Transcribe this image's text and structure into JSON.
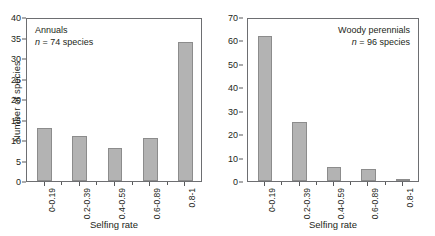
{
  "figure": {
    "background": "#ffffff",
    "bar_fill": "#b3b3b3",
    "bar_stroke": "#8c8c8c",
    "axis_color": "#6d6e71"
  },
  "chart_data": [
    {
      "type": "bar",
      "title": "Annuals",
      "subtitle": "n = 74 species",
      "subtitle_italic_prefix": "n",
      "subtitle_rest": " = 74 species",
      "categories": [
        "0-0.19",
        "0.2-0.39",
        "0.4-0.59",
        "0.6-0.89",
        "0.8-1"
      ],
      "values": [
        13,
        11,
        8,
        10.5,
        34
      ],
      "xlabel": "Selfing rate",
      "ylabel": "Number of species",
      "ylim": [
        0,
        40
      ],
      "yticks": [
        0,
        5,
        10,
        15,
        20,
        25,
        30,
        35,
        40
      ],
      "ytick_labels": [
        "0",
        "5",
        "10",
        "15",
        "20",
        "25",
        "30",
        "35",
        "40"
      ],
      "grid": false,
      "legend": "none",
      "caption_position": "top-left"
    },
    {
      "type": "bar",
      "title": "Woody perennials",
      "subtitle": "n = 96 species",
      "subtitle_italic_prefix": "n",
      "subtitle_rest": " = 96 species",
      "categories": [
        "0-0.19",
        "0.2-0.39",
        "0.4-0.59",
        "0.6-0.89",
        "0.8-1"
      ],
      "values": [
        62,
        25,
        6,
        5,
        1
      ],
      "xlabel": "Selfing rate",
      "ylabel": "",
      "ylim": [
        0,
        70
      ],
      "yticks": [
        0,
        10,
        20,
        30,
        40,
        50,
        60,
        70
      ],
      "ytick_labels": [
        "0",
        "10",
        "20",
        "30",
        "40",
        "50",
        "60",
        "70"
      ],
      "grid": false,
      "legend": "none",
      "caption_position": "top-right"
    }
  ]
}
